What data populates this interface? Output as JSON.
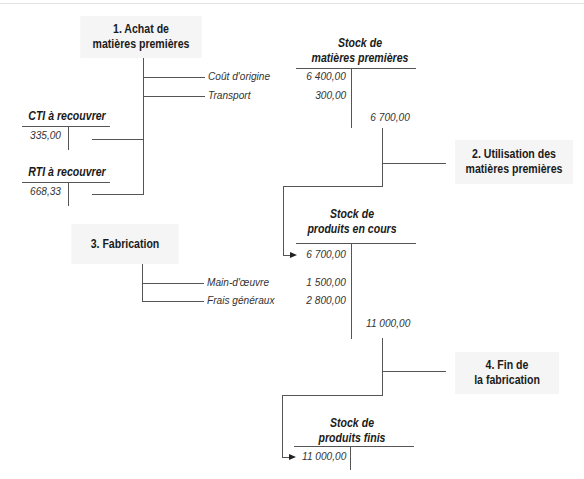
{
  "steps": {
    "step1": {
      "line1": "1. Achat de",
      "line2": "matières premières"
    },
    "step2": {
      "line1": "2. Utilisation des",
      "line2": "matières premières"
    },
    "step3": {
      "line1": "3. Fabrication"
    },
    "step4": {
      "line1": "4. Fin de",
      "line2": "la fabrication"
    }
  },
  "flow_labels": {
    "cout_origine": "Coût d'origine",
    "transport": "Transport",
    "main_oeuvre": "Main-d'œuvre",
    "frais_generaux": "Frais généraux"
  },
  "accounts": {
    "cti": {
      "title": "CTI à recouvrer",
      "debit": "335,00"
    },
    "rti": {
      "title": "RTI à recouvrer",
      "debit": "668,33"
    },
    "stock_mp": {
      "title1": "Stock de",
      "title2": "matières premières",
      "debit1": "6 400,00",
      "debit2": "300,00",
      "credit": "6 700,00"
    },
    "stock_pec": {
      "title1": "Stock de",
      "title2": "produits en cours",
      "debit1": "6 700,00",
      "debit2": "1 500,00",
      "debit3": "2 800,00",
      "credit": "11 000,00"
    },
    "stock_pf": {
      "title1": "Stock de",
      "title2": "produits finis",
      "debit1": "11 000,00"
    }
  }
}
